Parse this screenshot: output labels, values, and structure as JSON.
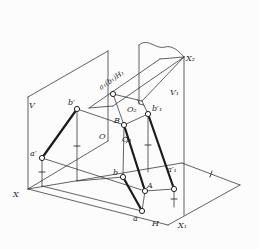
{
  "figure": {
    "background": "#fcfcfc",
    "ink": "#2f2f2f",
    "thick_ink": "#1b1b1b",
    "labels": [
      {
        "name": "label-plane-V",
        "text": "V",
        "x": 29,
        "y": 108
      },
      {
        "name": "label-plane-V1",
        "text": "V₁",
        "x": 170,
        "y": 95
      },
      {
        "name": "label-plane-H",
        "text": "H",
        "x": 152,
        "y": 226
      },
      {
        "name": "label-axis-X",
        "text": "X",
        "x": 13,
        "y": 197
      },
      {
        "name": "label-axis-X1",
        "text": "X₁",
        "x": 178,
        "y": 228
      },
      {
        "name": "label-axis-X2",
        "text": "X₂",
        "x": 186,
        "y": 61
      },
      {
        "name": "label-origin-O",
        "text": "O",
        "x": 99,
        "y": 139
      },
      {
        "name": "label-origin-O1",
        "text": "O₁",
        "x": 122,
        "y": 142
      },
      {
        "name": "label-origin-O2",
        "text": "O₂",
        "x": 127,
        "y": 112
      },
      {
        "name": "label-point-a-prime",
        "text": "a′",
        "x": 30,
        "y": 156
      },
      {
        "name": "label-point-b-prime",
        "text": "b′",
        "x": 68,
        "y": 105
      },
      {
        "name": "label-point-a",
        "text": "a",
        "x": 133,
        "y": 221
      },
      {
        "name": "label-point-b",
        "text": "b",
        "x": 113,
        "y": 175
      },
      {
        "name": "label-point-A",
        "text": "A",
        "x": 147,
        "y": 188
      },
      {
        "name": "label-point-B",
        "text": "B",
        "x": 114,
        "y": 123
      },
      {
        "name": "label-point-a1-prime",
        "text": "a′₁",
        "x": 167,
        "y": 172
      },
      {
        "name": "label-point-b1-prime",
        "text": "b′₁",
        "x": 152,
        "y": 111
      },
      {
        "name": "label-plane-H1-coincident-points",
        "text": "a₁(b₁)H₁",
        "x": 101,
        "y": 90,
        "rotate": -35,
        "small": true
      }
    ],
    "points": [
      {
        "name": "point-a-prime",
        "x": 42,
        "y": 158
      },
      {
        "name": "point-b-prime",
        "x": 77,
        "y": 109
      },
      {
        "name": "point-a",
        "x": 142,
        "y": 211
      },
      {
        "name": "point-b",
        "x": 123,
        "y": 177
      },
      {
        "name": "point-A",
        "x": 145,
        "y": 191
      },
      {
        "name": "point-B",
        "x": 124,
        "y": 125
      },
      {
        "name": "point-a1-prime",
        "x": 174,
        "y": 189
      },
      {
        "name": "point-b1-prime",
        "x": 148,
        "y": 114
      },
      {
        "name": "point-a1-b1-coincident",
        "x": 113,
        "y": 94
      }
    ],
    "thick_segments": [
      {
        "name": "segment-a-prime-b-prime",
        "x1": 42,
        "y1": 158,
        "x2": 77,
        "y2": 109
      },
      {
        "name": "segment-a-b",
        "x1": 123,
        "y1": 177,
        "x2": 142,
        "y2": 211
      },
      {
        "name": "segment-A-B",
        "x1": 124,
        "y1": 125,
        "x2": 145,
        "y2": 191
      },
      {
        "name": "segment-a1-prime-b1-prime",
        "x1": 148,
        "y1": 114,
        "x2": 174,
        "y2": 189
      }
    ],
    "thin_segments": [
      {
        "name": "plane-V-top-edge",
        "x1": 28,
        "y1": 97,
        "x2": 108,
        "y2": 51
      },
      {
        "name": "plane-V-right-edge",
        "x1": 108,
        "y1": 51,
        "x2": 108,
        "y2": 141
      },
      {
        "name": "plane-V-left-edge",
        "x1": 28,
        "y1": 97,
        "x2": 28,
        "y2": 189
      },
      {
        "name": "plane-V-bottom-edge",
        "x1": 28,
        "y1": 189,
        "x2": 108,
        "y2": 141
      },
      {
        "name": "plane-H-back-edge",
        "x1": 28,
        "y1": 189,
        "x2": 182,
        "y2": 163
      },
      {
        "name": "plane-H-right-back-edge",
        "x1": 182,
        "y1": 163,
        "x2": 240,
        "y2": 185
      },
      {
        "name": "plane-H-right-front-edge",
        "x1": 240,
        "y1": 185,
        "x2": 168,
        "y2": 225
      },
      {
        "name": "plane-H-front-edge",
        "x1": 168,
        "y1": 225,
        "x2": 28,
        "y2": 189
      },
      {
        "name": "plane-V1-left-edge",
        "x1": 139,
        "y1": 45,
        "x2": 139,
        "y2": 104
      },
      {
        "name": "plane-V1-right-edge",
        "x1": 184,
        "y1": 57,
        "x2": 184,
        "y2": 215
      },
      {
        "name": "plane-H1-upper-edge",
        "x1": 89,
        "y1": 108,
        "x2": 160,
        "y2": 59
      },
      {
        "name": "plane-H1-top-edge",
        "x1": 160,
        "y1": 59,
        "x2": 184,
        "y2": 57
      },
      {
        "name": "plane-H1-lower-edge",
        "x1": 184,
        "y1": 57,
        "x2": 113,
        "y2": 106
      },
      {
        "name": "plane-H1-left-edge",
        "x1": 113,
        "y1": 106,
        "x2": 89,
        "y2": 108
      },
      {
        "name": "axis-X2-line",
        "x1": 142,
        "y1": 101,
        "x2": 184,
        "y2": 57
      },
      {
        "name": "line-a1b1-to-O2",
        "x1": 113,
        "y1": 94,
        "x2": 142,
        "y2": 101
      },
      {
        "name": "line-O2-to-b1-prime",
        "x1": 142,
        "y1": 101,
        "x2": 148,
        "y2": 114
      },
      {
        "name": "ray-B-to-a1b1",
        "x1": 124,
        "y1": 125,
        "x2": 113,
        "y2": 94
      },
      {
        "name": "recall-b-prime-down",
        "x1": 77,
        "y1": 109,
        "x2": 77,
        "y2": 181
      },
      {
        "name": "recall-b-prime-to-b",
        "x1": 77,
        "y1": 181,
        "x2": 123,
        "y2": 177
      },
      {
        "name": "recall-a-prime-down",
        "x1": 42,
        "y1": 158,
        "x2": 42,
        "y2": 186
      },
      {
        "name": "recall-a-prime-to-a",
        "x1": 42,
        "y1": 186,
        "x2": 142,
        "y2": 211
      },
      {
        "name": "recall-B-to-b",
        "x1": 124,
        "y1": 125,
        "x2": 123,
        "y2": 177
      },
      {
        "name": "recall-b1-prime-down",
        "x1": 148,
        "y1": 114,
        "x2": 148,
        "y2": 172
      },
      {
        "name": "recall-a1-prime-down",
        "x1": 174,
        "y1": 189,
        "x2": 174,
        "y2": 207
      },
      {
        "name": "recall-A-to-a",
        "x1": 145,
        "y1": 191,
        "x2": 142,
        "y2": 211
      },
      {
        "name": "ray-b-prime-to-B",
        "x1": 77,
        "y1": 109,
        "x2": 124,
        "y2": 125
      },
      {
        "name": "ray-a-prime-to-A",
        "x1": 42,
        "y1": 158,
        "x2": 145,
        "y2": 191
      },
      {
        "name": "ray-B-to-b1-prime",
        "x1": 124,
        "y1": 125,
        "x2": 148,
        "y2": 114
      },
      {
        "name": "ray-A-to-a1-prime",
        "x1": 145,
        "y1": 191,
        "x2": 174,
        "y2": 189
      }
    ],
    "curves": [
      {
        "name": "plane-V1-torn-top-edge",
        "d": "M139,45 C148,37 156,50 165,47 C172,45 179,51 184,57"
      }
    ],
    "ticks": [
      {
        "name": "tick-b-prime-recall",
        "x1": 74,
        "y1": 146,
        "x2": 80,
        "y2": 146
      },
      {
        "name": "tick-a-prime-recall",
        "x1": 39,
        "y1": 172,
        "x2": 45,
        "y2": 172
      },
      {
        "name": "tick-b1-prime-recall",
        "x1": 145,
        "y1": 145,
        "x2": 151,
        "y2": 145
      },
      {
        "name": "tick-a1-prime-recall",
        "x1": 171,
        "y1": 199,
        "x2": 177,
        "y2": 199
      },
      {
        "name": "tick-H-right-back-edge",
        "x1": 212,
        "y1": 171,
        "x2": 210,
        "y2": 177
      }
    ],
    "angle_markers": [
      {
        "name": "right-angle-marker-O2",
        "points": "137.6,99.9 139.5,104 143.9,105.1"
      },
      {
        "name": "right-angle-marker-O1",
        "points": "126,137 129,140 126,143"
      }
    ]
  }
}
